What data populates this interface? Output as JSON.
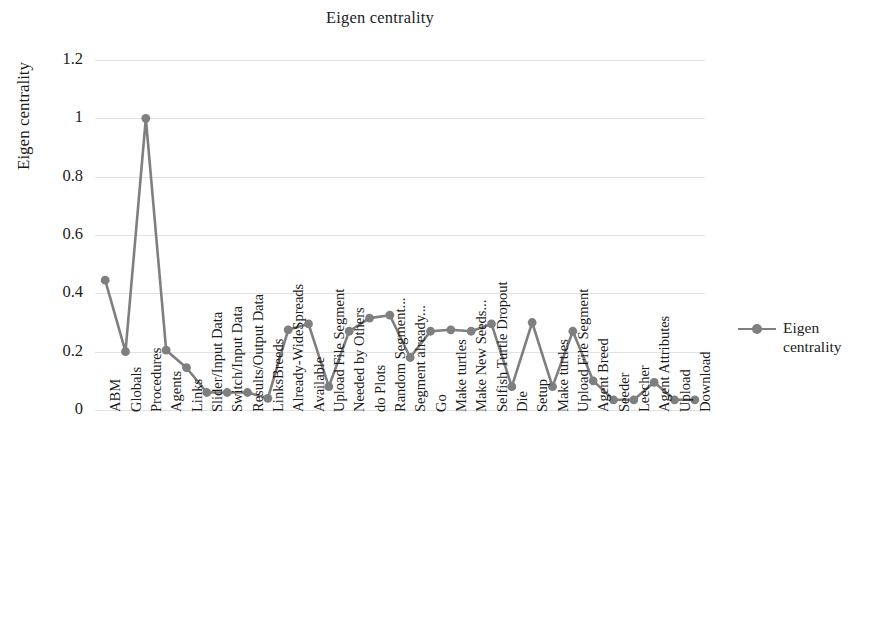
{
  "chart_data": {
    "type": "line",
    "title": "Eigen centrality",
    "xlabel": "",
    "ylabel": "Eigen centrality",
    "ylim": [
      0,
      1.2
    ],
    "yticks": [
      0,
      0.2,
      0.4,
      0.6,
      0.8,
      1,
      1.2
    ],
    "ytick_labels": [
      "0",
      "0.2",
      "0.4",
      "0.6",
      "0.8",
      "1",
      "1.2"
    ],
    "grid": true,
    "legend_position": "right",
    "series_color": "#7f7f7f",
    "categories": [
      "ABM",
      "Globals",
      "Procedures",
      "Agents",
      "Links",
      "Slider/Input Data",
      "Switch/Input Data",
      "Results/Output Data",
      "LinksBreeds",
      "Already-WideSpreads",
      "Available",
      "Upload File Segment",
      "Needed by Others",
      "do Plots",
      "Random Segment...",
      "Segment already...",
      "Go",
      "Make turtles",
      "Make New Seeds...",
      "Selfish Turtle Dropout",
      "Die",
      "Setup",
      "Make turtles",
      "Upload File Segment",
      "Agent Breed",
      "Seeder",
      "Leecher",
      "Agent Attributes",
      "Upload",
      "Download"
    ],
    "series": [
      {
        "name": "Eigen centrality",
        "values": [
          0.445,
          0.2,
          1.0,
          0.205,
          0.145,
          0.06,
          0.06,
          0.06,
          0.04,
          0.275,
          0.295,
          0.08,
          0.27,
          0.315,
          0.325,
          0.18,
          0.27,
          0.275,
          0.27,
          0.295,
          0.08,
          0.3,
          0.08,
          0.27,
          0.1,
          0.035,
          0.035,
          0.095,
          0.035,
          0.035
        ]
      }
    ],
    "legend": [
      "Eigen centrality"
    ]
  },
  "legend": {
    "label_line1": "Eigen",
    "label_line2": "centrality"
  }
}
